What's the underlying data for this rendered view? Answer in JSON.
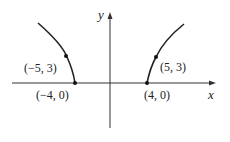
{
  "diagram": {
    "type": "hyperbola-graph",
    "axes": {
      "x_label": "x",
      "y_label": "y"
    },
    "points": [
      {
        "label": "(−5, 3)",
        "x": -5,
        "y": 3
      },
      {
        "label": "(−4, 0)",
        "x": -4,
        "y": 0
      },
      {
        "label": "(5, 3)",
        "x": 5,
        "y": 3
      },
      {
        "label": "(4, 0)",
        "x": 4,
        "y": 0
      }
    ],
    "colors": {
      "curve": "#222222",
      "axis": "#333333"
    }
  }
}
